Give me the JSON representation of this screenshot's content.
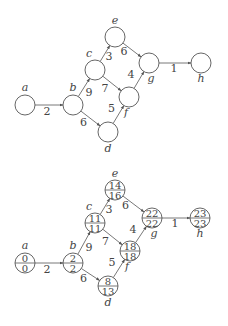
{
  "diagrams": [
    {
      "name": "network-unlabeled",
      "nodes": [
        {
          "id": "a",
          "label": "a"
        },
        {
          "id": "b",
          "label": "b"
        },
        {
          "id": "c",
          "label": "c"
        },
        {
          "id": "d",
          "label": "d"
        },
        {
          "id": "e",
          "label": "e"
        },
        {
          "id": "f",
          "label": "f"
        },
        {
          "id": "g",
          "label": "g"
        },
        {
          "id": "h",
          "label": "h"
        }
      ],
      "edges": [
        {
          "from": "a",
          "to": "b",
          "weight": "2"
        },
        {
          "from": "b",
          "to": "c",
          "weight": "9"
        },
        {
          "from": "b",
          "to": "d",
          "weight": "6"
        },
        {
          "from": "c",
          "to": "e",
          "weight": "3"
        },
        {
          "from": "c",
          "to": "f",
          "weight": "7"
        },
        {
          "from": "d",
          "to": "f",
          "weight": "5"
        },
        {
          "from": "e",
          "to": "g",
          "weight": "6"
        },
        {
          "from": "f",
          "to": "g",
          "weight": "4"
        },
        {
          "from": "g",
          "to": "h",
          "weight": "1"
        }
      ]
    },
    {
      "name": "network-with-times",
      "nodes": [
        {
          "id": "a",
          "label": "a",
          "top": "0",
          "bottom": "0"
        },
        {
          "id": "b",
          "label": "b",
          "top": "2",
          "bottom": "2"
        },
        {
          "id": "c",
          "label": "c",
          "top": "11",
          "bottom": "11"
        },
        {
          "id": "d",
          "label": "d",
          "top": "8",
          "bottom": "13"
        },
        {
          "id": "e",
          "label": "e",
          "top": "14",
          "bottom": "16"
        },
        {
          "id": "f",
          "label": "f",
          "top": "18",
          "bottom": "18"
        },
        {
          "id": "g",
          "label": "g",
          "top": "22",
          "bottom": "22"
        },
        {
          "id": "h",
          "label": "h",
          "top": "23",
          "bottom": "23"
        }
      ],
      "edges": [
        {
          "from": "a",
          "to": "b",
          "weight": "2"
        },
        {
          "from": "b",
          "to": "c",
          "weight": "9"
        },
        {
          "from": "b",
          "to": "d",
          "weight": "6"
        },
        {
          "from": "c",
          "to": "e",
          "weight": "3"
        },
        {
          "from": "c",
          "to": "f",
          "weight": "7"
        },
        {
          "from": "d",
          "to": "f",
          "weight": "5"
        },
        {
          "from": "e",
          "to": "g",
          "weight": "6"
        },
        {
          "from": "f",
          "to": "g",
          "weight": "4"
        },
        {
          "from": "g",
          "to": "h",
          "weight": "1"
        }
      ]
    }
  ]
}
